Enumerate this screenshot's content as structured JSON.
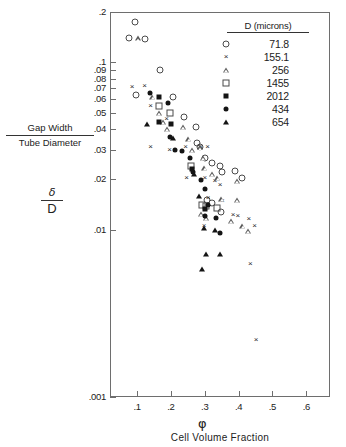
{
  "figure": {
    "x_axis_symbol": "φ",
    "x_axis_title": "Cell Volume Fraction",
    "y_axis_title_numerator": "Gap Width",
    "y_axis_title_denominator": "Tube Diameter",
    "y_axis_symbol_numerator": "δ",
    "y_axis_symbol_denominator": "D"
  },
  "legend": {
    "title": "D (microns)",
    "entries": [
      {
        "label": "71.8",
        "marker": "open-circle"
      },
      {
        "label": "155.1",
        "marker": "cross"
      },
      {
        "label": "256",
        "marker": "open-triangle"
      },
      {
        "label": "1455",
        "marker": "open-square"
      },
      {
        "label": "2012",
        "marker": "filled-square"
      },
      {
        "label": "434",
        "marker": "filled-circle"
      },
      {
        "label": "654",
        "marker": "filled-triangle"
      }
    ]
  },
  "chart_data": {
    "type": "scatter",
    "title": "",
    "xlabel": "Cell Volume Fraction",
    "xsymbol": "φ",
    "ylabel": "Gap Width / Tube Diameter",
    "ysymbol": "δ/D",
    "xscale": "linear",
    "yscale": "log",
    "xlim": [
      0.02,
      0.67
    ],
    "ylim": [
      0.001,
      0.2
    ],
    "grid": false,
    "legend_position": "top-right",
    "xticks": [
      0.1,
      0.2,
      0.3,
      0.4,
      0.5,
      0.6
    ],
    "xticklabels": [
      ".1",
      ".2",
      ".3",
      ".4",
      ".5",
      ".6"
    ],
    "yticks": [
      0.001,
      0.01,
      0.02,
      0.03,
      0.04,
      0.05,
      0.06,
      0.07,
      0.08,
      0.09,
      0.1,
      0.2
    ],
    "yticklabels": [
      ".001",
      ".01",
      ".02",
      ".03",
      ".04",
      ".05",
      ".06",
      ".07",
      ".08",
      ".09",
      ".1",
      ".2"
    ],
    "series": [
      {
        "name": "71.8",
        "marker": "open-circle",
        "points": [
          [
            0.093,
            0.175
          ],
          [
            0.075,
            0.14
          ],
          [
            0.122,
            0.137
          ],
          [
            0.168,
            0.09
          ],
          [
            0.097,
            0.064
          ],
          [
            0.205,
            0.062
          ],
          [
            0.238,
            0.047
          ],
          [
            0.273,
            0.041
          ],
          [
            0.276,
            0.033
          ],
          [
            0.285,
            0.031
          ],
          [
            0.3,
            0.027
          ],
          [
            0.322,
            0.025
          ],
          [
            0.345,
            0.024
          ],
          [
            0.352,
            0.022
          ],
          [
            0.306,
            0.015
          ],
          [
            0.321,
            0.0145
          ],
          [
            0.388,
            0.0225
          ],
          [
            0.411,
            0.0205
          ],
          [
            0.347,
            0.0128
          ]
        ]
      },
      {
        "name": "155.1",
        "marker": "cross",
        "points": [
          [
            0.085,
            0.071
          ],
          [
            0.122,
            0.072
          ],
          [
            0.14,
            0.055
          ],
          [
            0.187,
            0.046
          ],
          [
            0.14,
            0.031
          ],
          [
            0.196,
            0.03
          ],
          [
            0.243,
            0.031
          ],
          [
            0.288,
            0.031
          ],
          [
            0.308,
            0.031
          ],
          [
            0.246,
            0.0205
          ],
          [
            0.3,
            0.0205
          ],
          [
            0.33,
            0.0195
          ],
          [
            0.345,
            0.0185
          ],
          [
            0.31,
            0.0155
          ],
          [
            0.352,
            0.0148
          ],
          [
            0.384,
            0.0122
          ],
          [
            0.398,
            0.012
          ],
          [
            0.43,
            0.0116
          ],
          [
            0.298,
            0.0105
          ],
          [
            0.447,
            0.0105
          ],
          [
            0.435,
            0.0062
          ],
          [
            0.452,
            0.0022
          ]
        ]
      },
      {
        "name": "256",
        "marker": "open-triangle",
        "points": [
          [
            0.103,
            0.139
          ],
          [
            0.146,
            0.062
          ],
          [
            0.166,
            0.05
          ],
          [
            0.178,
            0.044
          ],
          [
            0.19,
            0.04
          ],
          [
            0.236,
            0.041
          ],
          [
            0.253,
            0.035
          ],
          [
            0.262,
            0.03
          ],
          [
            0.286,
            0.031
          ],
          [
            0.296,
            0.027
          ],
          [
            0.3,
            0.0235
          ],
          [
            0.322,
            0.0215
          ],
          [
            0.338,
            0.0205
          ],
          [
            0.395,
            0.0195
          ],
          [
            0.35,
            0.0152
          ],
          [
            0.396,
            0.015
          ],
          [
            0.29,
            0.0124
          ],
          [
            0.305,
            0.0118
          ],
          [
            0.378,
            0.0113
          ],
          [
            0.412,
            0.0105
          ],
          [
            0.428,
            0.0098
          ]
        ]
      },
      {
        "name": "1455",
        "marker": "open-square",
        "points": [
          [
            0.166,
            0.055
          ],
          [
            0.198,
            0.05
          ],
          [
            0.258,
            0.024
          ],
          [
            0.293,
            0.014
          ],
          [
            0.303,
            0.0138
          ],
          [
            0.335,
            0.0135
          ]
        ]
      },
      {
        "name": "2012",
        "marker": "filled-square",
        "points": [
          [
            0.166,
            0.062
          ],
          [
            0.166,
            0.044
          ],
          [
            0.2,
            0.043
          ],
          [
            0.263,
            0.0232
          ],
          [
            0.3,
            0.0133
          ]
        ]
      },
      {
        "name": "434",
        "marker": "filled-circle",
        "points": [
          [
            0.137,
            0.066
          ],
          [
            0.19,
            0.057
          ],
          [
            0.196,
            0.036
          ],
          [
            0.211,
            0.03
          ],
          [
            0.234,
            0.0295
          ],
          [
            0.256,
            0.0268
          ],
          [
            0.266,
            0.0222
          ],
          [
            0.29,
            0.0198
          ],
          [
            0.3,
            0.0175
          ],
          [
            0.31,
            0.014
          ],
          [
            0.3,
            0.012
          ],
          [
            0.332,
            0.0118
          ],
          [
            0.345,
            0.0095
          ]
        ]
      },
      {
        "name": "654",
        "marker": "filled-triangle",
        "points": [
          [
            0.128,
            0.043
          ],
          [
            0.206,
            0.0352
          ],
          [
            0.268,
            0.0215
          ],
          [
            0.284,
            0.0158
          ],
          [
            0.297,
            0.0103
          ],
          [
            0.33,
            0.01
          ],
          [
            0.305,
            0.0072
          ],
          [
            0.345,
            0.0072
          ],
          [
            0.292,
            0.0058
          ]
        ]
      }
    ]
  }
}
